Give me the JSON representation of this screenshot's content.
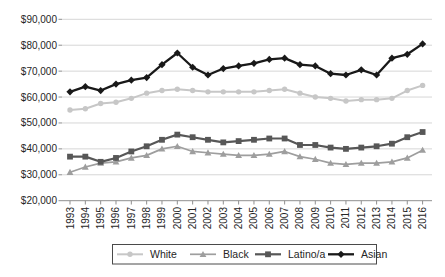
{
  "chart_data": {
    "type": "line",
    "title": "",
    "xlabel": "",
    "ylabel": "",
    "x": [
      "1993",
      "1994",
      "1995",
      "1996",
      "1997",
      "1998",
      "1999",
      "2000",
      "2001",
      "2002",
      "2003",
      "2004",
      "2005",
      "2006",
      "2007",
      "2008",
      "2009",
      "2010",
      "2011",
      "2012",
      "2013",
      "2014",
      "2015",
      "2016"
    ],
    "ylim": [
      20000,
      90000
    ],
    "y_ticks": [
      {
        "value": 20000,
        "label": "$20,000"
      },
      {
        "value": 30000,
        "label": "$30,000"
      },
      {
        "value": 40000,
        "label": "$40,000"
      },
      {
        "value": 50000,
        "label": "$50,000"
      },
      {
        "value": 60000,
        "label": "$60,000"
      },
      {
        "value": 70000,
        "label": "$70,000"
      },
      {
        "value": 80000,
        "label": "$80,000"
      },
      {
        "value": 90000,
        "label": "$90,000"
      }
    ],
    "grid": "horizontal",
    "legend_position": "bottom",
    "series": [
      {
        "name": "White",
        "marker": "circle",
        "color": "#c7c7c7",
        "values": [
          55000,
          55500,
          57500,
          58000,
          59500,
          61500,
          62500,
          63000,
          62500,
          62000,
          62000,
          62000,
          62000,
          62500,
          63000,
          61500,
          60000,
          59500,
          58500,
          59000,
          59000,
          59500,
          62500,
          64500
        ]
      },
      {
        "name": "Black",
        "marker": "triangle",
        "color": "#9e9e9e",
        "values": [
          31000,
          33000,
          34500,
          35000,
          36500,
          37500,
          40000,
          41000,
          39000,
          38500,
          38000,
          37500,
          37500,
          38000,
          39000,
          37000,
          36000,
          34500,
          34000,
          34500,
          34500,
          35000,
          36500,
          39500
        ]
      },
      {
        "name": "Latino/a",
        "marker": "square",
        "color": "#575757",
        "values": [
          37000,
          37000,
          35000,
          36500,
          39000,
          41000,
          43500,
          45500,
          44500,
          43500,
          42500,
          43000,
          43500,
          44000,
          44000,
          41500,
          41500,
          40500,
          40000,
          40500,
          41000,
          42000,
          44500,
          46500
        ]
      },
      {
        "name": "Asian",
        "marker": "diamond",
        "color": "#191919",
        "values": [
          62000,
          64000,
          62500,
          65000,
          66500,
          67500,
          72500,
          77000,
          71500,
          68500,
          71000,
          72000,
          73000,
          74500,
          75000,
          72500,
          72000,
          69000,
          68500,
          70500,
          68500,
          75000,
          76500,
          80500
        ]
      }
    ]
  },
  "style_colors": {
    "grid": "#d6d6d6",
    "axis": "#8f8f8f",
    "tick_label": "#262626",
    "legend_border": "#4a4a4a",
    "background": "#ffffff"
  }
}
